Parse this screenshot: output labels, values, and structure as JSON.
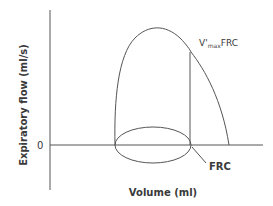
{
  "diagram": {
    "type": "flow-volume loop",
    "y_axis_label": "Expiratory flow (ml/s)",
    "x_axis_label": "Volume (ml)",
    "zero_tick": "0",
    "annotations": {
      "vmax_prefix": "V'",
      "vmax_sub": "max",
      "vmax_suffix": "FRC",
      "frc_label": "FRC"
    },
    "colors": {
      "line": "#555555",
      "text": "#3a3a3a",
      "background": "#ffffff"
    }
  }
}
